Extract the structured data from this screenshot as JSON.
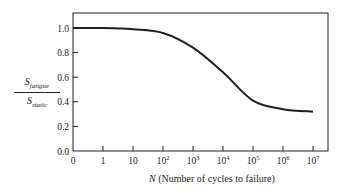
{
  "chart_data": {
    "type": "line",
    "title": "",
    "xlabel": "N (Number of cycles to failure)",
    "xlabel_parts": {
      "var": "N",
      "rest": " (Number of cycles to failure)"
    },
    "ylabel": "S_fatigue / S_static",
    "ylabel_parts": {
      "num_base": "S",
      "num_sub": "fatigue",
      "den_base": "S",
      "den_sub": "static"
    },
    "x_scale": "log (categorical decades)",
    "x_ticks": [
      "0",
      "1",
      "10",
      "10^2",
      "10^3",
      "10^4",
      "10^5",
      "10^6",
      "10^7"
    ],
    "x_tick_display": [
      {
        "base": "0",
        "exp": ""
      },
      {
        "base": "1",
        "exp": ""
      },
      {
        "base": "10",
        "exp": ""
      },
      {
        "base": "10",
        "exp": "2"
      },
      {
        "base": "10",
        "exp": "3"
      },
      {
        "base": "10",
        "exp": "4"
      },
      {
        "base": "10",
        "exp": "5"
      },
      {
        "base": "10",
        "exp": "6"
      },
      {
        "base": "10",
        "exp": "7"
      }
    ],
    "y_ticks": [
      "0.0",
      "0.2",
      "0.4",
      "0.6",
      "0.8",
      "1.0"
    ],
    "ylim": [
      0,
      1.1
    ],
    "grid": false,
    "legend": null,
    "series": [
      {
        "name": "S_fatigue / S_static",
        "color": "#231f20",
        "points": [
          {
            "x": "0",
            "y": 1.0
          },
          {
            "x": "1",
            "y": 1.0
          },
          {
            "x": "10",
            "y": 0.99
          },
          {
            "x": "10^2",
            "y": 0.96
          },
          {
            "x": "10^3",
            "y": 0.84
          },
          {
            "x": "10^4",
            "y": 0.64
          },
          {
            "x": "10^5",
            "y": 0.41
          },
          {
            "x": "10^6",
            "y": 0.34
          },
          {
            "x": "10^7",
            "y": 0.32
          }
        ]
      }
    ]
  }
}
